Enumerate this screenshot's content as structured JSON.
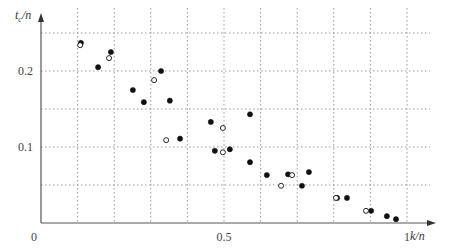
{
  "chart_data": {
    "type": "scatter",
    "title": "",
    "xlabel": "k/n",
    "ylabel": "t_c/n",
    "xlim": [
      0,
      1.06
    ],
    "ylim": [
      0,
      0.27
    ],
    "grid": true,
    "grid_style": "dotted",
    "x_ticks": [
      {
        "value": 0,
        "label": "0"
      },
      {
        "value": 0.5,
        "label": "0.5"
      },
      {
        "value": 1,
        "label": "1"
      }
    ],
    "y_ticks": [
      {
        "value": 0.1,
        "label": "0.1"
      },
      {
        "value": 0.2,
        "label": "0.2"
      }
    ],
    "x_grid": [
      0.1,
      0.2,
      0.3,
      0.4,
      0.5,
      0.6,
      0.7,
      0.8,
      0.9,
      1.0
    ],
    "y_grid": [
      0.05,
      0.1,
      0.15,
      0.2,
      0.25
    ],
    "series": [
      {
        "name": "filled",
        "marker": "filled-circle",
        "color": "#111111",
        "points": [
          [
            0.109,
            0.237
          ],
          [
            0.191,
            0.225
          ],
          [
            0.156,
            0.205
          ],
          [
            0.251,
            0.175
          ],
          [
            0.328,
            0.2
          ],
          [
            0.281,
            0.159
          ],
          [
            0.352,
            0.161
          ],
          [
            0.38,
            0.111
          ],
          [
            0.464,
            0.133
          ],
          [
            0.475,
            0.095
          ],
          [
            0.516,
            0.097
          ],
          [
            0.571,
            0.143
          ],
          [
            0.571,
            0.08
          ],
          [
            0.617,
            0.063
          ],
          [
            0.675,
            0.064
          ],
          [
            0.732,
            0.067
          ],
          [
            0.713,
            0.049
          ],
          [
            0.809,
            0.033
          ],
          [
            0.836,
            0.033
          ],
          [
            0.902,
            0.016
          ],
          [
            0.945,
            0.009
          ],
          [
            0.97,
            0.005
          ]
        ]
      },
      {
        "name": "open",
        "marker": "open-circle",
        "color": "#111111",
        "points": [
          [
            0.107,
            0.234
          ],
          [
            0.186,
            0.217
          ],
          [
            0.309,
            0.188
          ],
          [
            0.342,
            0.109
          ],
          [
            0.497,
            0.125
          ],
          [
            0.497,
            0.093
          ],
          [
            0.656,
            0.049
          ],
          [
            0.686,
            0.063
          ],
          [
            0.806,
            0.033
          ],
          [
            0.888,
            0.016
          ]
        ]
      }
    ]
  },
  "labels": {
    "origin": "0",
    "x_axis": "k/n",
    "y_axis_main": "t",
    "y_axis_sub": "c",
    "y_axis_rest": "/n"
  }
}
